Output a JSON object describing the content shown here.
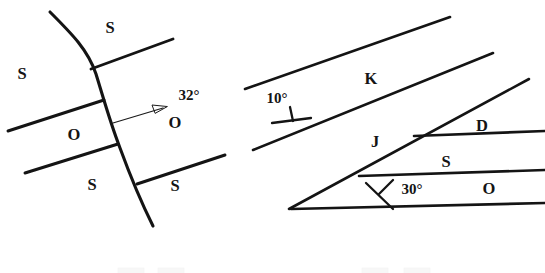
{
  "figure": {
    "background_color": "#ffffff",
    "line_color": "#141414",
    "width": 545,
    "height": 273
  },
  "left_map": {
    "name": "folded-faulted-map",
    "description": "Curved fault trace cutting three offset contacts between stratigraphic units",
    "unit_labels": [
      {
        "text": "S",
        "x": 110,
        "y": 29
      },
      {
        "text": "S",
        "x": 22,
        "y": 75
      },
      {
        "text": "O",
        "x": 74,
        "y": 136
      },
      {
        "text": "O",
        "x": 175,
        "y": 124
      },
      {
        "text": "S",
        "x": 92,
        "y": 186
      },
      {
        "text": "S",
        "x": 175,
        "y": 187
      }
    ],
    "dip_measurement": {
      "label": "32°",
      "x": 189,
      "y": 97,
      "arrow_from": {
        "x": 113,
        "y": 123
      },
      "arrow_to": {
        "x": 166,
        "y": 107
      }
    },
    "fault_trace": "M 50 12 C 72 34, 88 50, 96 74 C 104 100, 110 122, 120 148 C 131 178, 142 204, 153 226",
    "contacts": [
      {
        "name": "contact-upper",
        "x1": 91,
        "y1": 69,
        "x2": 173,
        "y2": 39
      },
      {
        "name": "contact-mid-left",
        "x1": 8,
        "y1": 131,
        "x2": 104,
        "y2": 100
      },
      {
        "name": "contact-lower-left",
        "x1": 25,
        "y1": 173,
        "x2": 118,
        "y2": 144
      },
      {
        "name": "contact-lower-right",
        "x1": 137,
        "y1": 184,
        "x2": 225,
        "y2": 155
      }
    ]
  },
  "right_map": {
    "name": "tilted-strata-map",
    "description": "Wedge of dipping strata with stratigraphic contacts and two strike-and-dip symbols",
    "unit_labels": [
      {
        "text": "K",
        "x": 371,
        "y": 80
      },
      {
        "text": "J",
        "x": 375,
        "y": 143
      },
      {
        "text": "D",
        "x": 482,
        "y": 127
      },
      {
        "text": "S",
        "x": 446,
        "y": 163
      },
      {
        "text": "O",
        "x": 489,
        "y": 190
      }
    ],
    "dip_measurements": [
      {
        "label": "10°",
        "x": 277,
        "y": 100,
        "strike_line": {
          "x1": 272,
          "y1": 123,
          "x2": 311,
          "y2": 118
        },
        "dip_tick": {
          "x1": 289,
          "y1": 108,
          "x2": 293,
          "y2": 121
        }
      },
      {
        "label": "30°",
        "x": 412,
        "y": 191,
        "strike_line": {
          "x1": 366,
          "y1": 183,
          "x2": 393,
          "y2": 209
        },
        "dip_tick": {
          "x1": 392,
          "y1": 180,
          "x2": 380,
          "y2": 194
        }
      }
    ],
    "strata_lines": [
      {
        "name": "k-top-line",
        "x1": 245,
        "y1": 89,
        "x2": 450,
        "y2": 17
      },
      {
        "name": "k-base-line",
        "x1": 253,
        "y1": 150,
        "x2": 493,
        "y2": 53
      },
      {
        "name": "j-base-line",
        "x1": 289,
        "y1": 209,
        "x2": 529,
        "y2": 79
      },
      {
        "name": "d-base-line",
        "x1": 414,
        "y1": 136,
        "x2": 545,
        "y2": 131
      },
      {
        "name": "s-base-line",
        "x1": 359,
        "y1": 176,
        "x2": 545,
        "y2": 170
      },
      {
        "name": "o-top-line",
        "x1": 291,
        "y1": 209,
        "x2": 545,
        "y2": 203
      }
    ]
  },
  "legend": {
    "name": "legend-strip-cropped",
    "note": "Legend swatches cropped at bottom edge of figure",
    "swatches": [
      {
        "x": 118,
        "y": 268,
        "w": 26,
        "h": 6
      },
      {
        "x": 158,
        "y": 268,
        "w": 26,
        "h": 6
      },
      {
        "x": 362,
        "y": 268,
        "w": 26,
        "h": 6
      },
      {
        "x": 404,
        "y": 268,
        "w": 26,
        "h": 6
      }
    ]
  }
}
